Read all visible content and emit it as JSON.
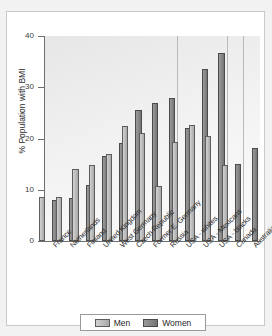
{
  "chart_data": {
    "type": "bar",
    "title": "",
    "xlabel": "",
    "ylabel": "% Population with BMI",
    "ylim": [
      0,
      40
    ],
    "yticks": [
      0,
      10,
      20,
      30,
      40
    ],
    "grid": false,
    "legend_position": "bottom",
    "categories": [
      "France",
      "Netherlands",
      "Finland",
      "United Kingdom",
      "West Germany",
      "Czech Republic",
      "Former E. Germany",
      "Russia",
      "USA - whites",
      "USA - Mexicans",
      "USA - blacks",
      "Canada",
      "Australia"
    ],
    "series": [
      {
        "name": "Men",
        "color": "#bfbfbf",
        "values": [
          8.5,
          8.5,
          14.1,
          14.9,
          16.9,
          22.5,
          21.0,
          10.8,
          19.3,
          22.6,
          20.4,
          14.9,
          null
        ]
      },
      {
        "name": "Women",
        "color": "#8a8a8a",
        "values": [
          8.0,
          8.4,
          11.0,
          16.5,
          19.1,
          25.5,
          27.0,
          27.9,
          22.1,
          33.5,
          36.7,
          15.1,
          18.1
        ]
      }
    ],
    "panel_separators_after": [
      "Russia",
      "USA - blacks",
      "Canada"
    ]
  },
  "legend": {
    "entries": [
      {
        "label": "Men"
      },
      {
        "label": "Women"
      }
    ]
  },
  "colors": {
    "men": "#bfbfbf",
    "women": "#8a8a8a",
    "axis": "#6e6e6e",
    "separator": "#b9b9b9",
    "card_border": "#c9c9c9",
    "page_background": "#f2f2f2"
  }
}
